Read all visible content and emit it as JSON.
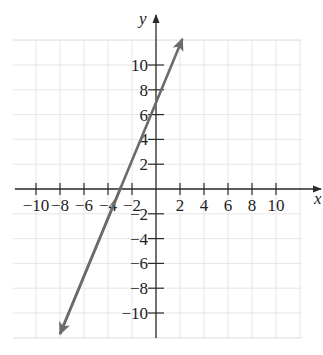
{
  "chart_data": {
    "type": "line",
    "title": "",
    "xlabel": "x",
    "ylabel": "y",
    "xlim": [
      -12,
      12
    ],
    "ylim": [
      -12,
      12
    ],
    "grid": true,
    "grid_step": 2,
    "x_ticks": [
      -10,
      -8,
      -6,
      -4,
      -2,
      2,
      4,
      6,
      8,
      10
    ],
    "y_ticks": [
      10,
      8,
      6,
      4,
      2,
      -2,
      -4,
      -6,
      -8,
      -10
    ],
    "x_tick_labels": [
      "−10",
      "−8",
      "−6",
      "−4",
      "−2",
      "2",
      "4",
      "6",
      "8",
      "10"
    ],
    "y_tick_labels": [
      "10",
      "8",
      "6",
      "4",
      "2",
      "−2",
      "−4",
      "−6",
      "−8",
      "−10"
    ],
    "series": [
      {
        "name": "line",
        "equation": "y = (7/3)x + 7",
        "x": [
          -8,
          2.2
        ],
        "y": [
          -11.7,
          12.1
        ],
        "x_intercept": -3,
        "y_intercept": 7,
        "arrows": "both",
        "color": "#6b6b6b"
      }
    ]
  },
  "colors": {
    "axis": "#2a2a2a",
    "grid": "#e6e6e6",
    "line": "#6b6b6b"
  }
}
